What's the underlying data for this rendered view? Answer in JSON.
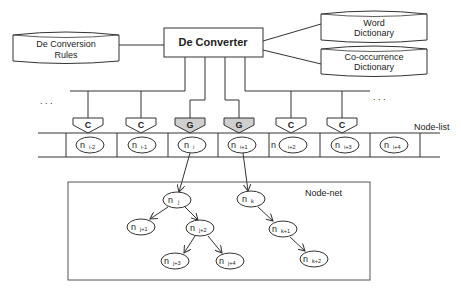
{
  "converter": {
    "label": "De Converter"
  },
  "rules_db": {
    "line1": "De Conversion",
    "line2": "Rules"
  },
  "word_db": {
    "line1": "Word",
    "line2": "Dictionary"
  },
  "cooc_db": {
    "line1": "Co-occurrence",
    "line2": "Dictionary"
  },
  "ellipsis_left": ". . .",
  "ellipsis_right": ". . .",
  "node_list": {
    "label": "Node-list",
    "connectors": [
      {
        "type": "C"
      },
      {
        "type": "C"
      },
      {
        "type": "G"
      },
      {
        "type": "G"
      },
      {
        "type": "C"
      },
      {
        "type": "C"
      }
    ],
    "cells": [
      {
        "base": "n",
        "sub": "i-2"
      },
      {
        "base": "n",
        "sub": "i-1"
      },
      {
        "base": "n",
        "sub": "i"
      },
      {
        "base": "n",
        "sub": "i+1"
      },
      {
        "base": "n",
        "sub": "i+2"
      },
      {
        "base": "n",
        "sub": "i+3"
      },
      {
        "base": "n",
        "sub": "i+4"
      }
    ]
  },
  "node_net": {
    "label": "Node-net",
    "nodes": {
      "j": {
        "base": "n",
        "sub": "j"
      },
      "j1": {
        "base": "n",
        "sub": "j+1"
      },
      "j2": {
        "base": "n",
        "sub": "j+2"
      },
      "j3": {
        "base": "n",
        "sub": "j+3"
      },
      "j4": {
        "base": "n",
        "sub": "j+4"
      },
      "k": {
        "base": "n",
        "sub": "k"
      },
      "k1": {
        "base": "n",
        "sub": "k+1"
      },
      "k2": {
        "base": "n",
        "sub": "k+2"
      }
    }
  },
  "colors": {
    "G_fill": "#cfcfcf",
    "line": "#333333"
  }
}
